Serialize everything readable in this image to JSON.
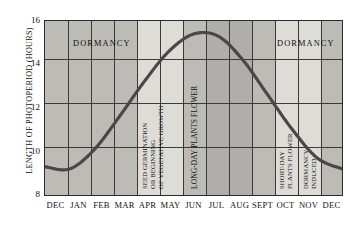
{
  "chart_data": {
    "type": "line",
    "title": "",
    "xlabel": "",
    "ylabel": "LENGTH OF PHOTOPERIOD (HOURS)",
    "ylim": [
      8,
      16
    ],
    "yticks": [
      8,
      10,
      12,
      14,
      16
    ],
    "grid": true,
    "legend": "none",
    "categories": [
      "DEC",
      "JAN",
      "FEB",
      "MAR",
      "APR",
      "MAY",
      "JUN",
      "JUL",
      "AUG",
      "SEPT",
      "OCT",
      "NOV",
      "DEC"
    ],
    "series": [
      {
        "name": "Photoperiod",
        "values": [
          9.3,
          9.2,
          10.1,
          11.6,
          13.2,
          14.6,
          15.4,
          15.3,
          14.2,
          12.6,
          11.0,
          9.7,
          9.2
        ]
      }
    ],
    "annotations": [
      {
        "text": "DORMANCY",
        "orientation": "horizontal",
        "region": "DEC-MAR"
      },
      {
        "text": "SEED GERMINATION OR BEGINNING OF VEGETATIVE GROWTH",
        "orientation": "vertical",
        "region": "APR-MAY"
      },
      {
        "text": "LONG-DAY PLANTS FLOWER",
        "orientation": "vertical",
        "region": "MAY-JUL"
      },
      {
        "text": "SHORT-DAY PLANTS FLOWER",
        "orientation": "vertical",
        "region": "AUG-SEPT"
      },
      {
        "text": "DORMANCY INDUCED",
        "orientation": "vertical",
        "region": "SEPT-OCT"
      },
      {
        "text": "DORMANCY",
        "orientation": "horizontal",
        "region": "OCT-DEC"
      }
    ]
  },
  "axis": {
    "y_title": "LENGTH OF PHOTOPERIOD (HOURS)",
    "y_ticks": [
      "16",
      "14",
      "12",
      "10",
      "8"
    ],
    "x_ticks": [
      "DEC",
      "JAN",
      "FEB",
      "MAR",
      "APR",
      "MAY",
      "JUN",
      "JUL",
      "AUG",
      "SEPT",
      "OCT",
      "NOV",
      "DEC"
    ]
  },
  "labels": {
    "dormancy_left": "DORMANCY",
    "dormancy_right": "DORMANCY",
    "seed_germination_l1": "SEED GERMINATION",
    "seed_germination_l2": "OR BEGINNING",
    "seed_germination_l3": "OF VEGETATIVE GROWTH",
    "long_day": "LONG-DAY PLANTS FLOWER",
    "short_day_l1": "SHORT-DAY",
    "short_day_l2": "PLANTS FLOWER",
    "dormancy_induced_l1": "DORMANCY",
    "dormancy_induced_l2": "INDUCED"
  },
  "colors": {
    "background": "#ffffff",
    "plot_fill_dark": "#bdbbb6",
    "plot_fill_mid": "#c9c7c2",
    "plot_fill_light": "#dedcd7",
    "grid": "#3a3a3a",
    "curve": "#4a4846",
    "text": "#111111"
  }
}
